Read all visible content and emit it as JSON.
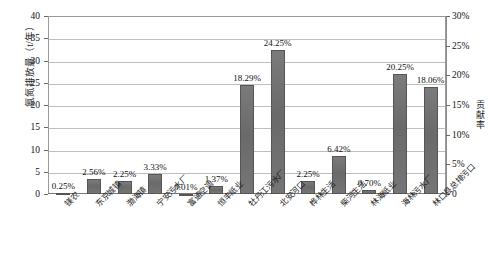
{
  "chart_data": {
    "type": "bar",
    "title": "",
    "xlabel": "",
    "ylabel": "氨氮排放量（t/年）",
    "y2label": "贡献率",
    "ylim": [
      0,
      40
    ],
    "y2lim": [
      0,
      0.3
    ],
    "grid": true,
    "legend": "none",
    "categories": [
      "镁农",
      "东京城镇",
      "渤海镇",
      "宁安污水厂",
      "富通空调",
      "恒丰纸业",
      "牡丹江污水厂",
      "北安河口",
      "桦林生活",
      "柴河生活",
      "林海纸业",
      "海林污水厂",
      "林口县总排污口"
    ],
    "values": [
      0.33,
      3.41,
      3.0,
      4.44,
      0.01,
      1.83,
      24.39,
      32.33,
      3.0,
      8.56,
      0.93,
      27.0,
      24.08
    ],
    "data_labels": [
      "0.25%",
      "2.56%",
      "2.25%",
      "3.33%",
      "0.01%",
      "1.37%",
      "18.29%",
      "24.25%",
      "2.25%",
      "6.42%",
      "0.70%",
      "20.25%",
      "18.06%"
    ],
    "contribution_rates": [
      0.25,
      2.56,
      2.25,
      3.33,
      0.01,
      1.37,
      18.29,
      24.25,
      2.25,
      6.42,
      0.7,
      20.25,
      18.06
    ],
    "yticks": [
      "0",
      "5",
      "10",
      "15",
      "20",
      "25",
      "30",
      "35",
      "40"
    ],
    "y2ticks": [
      "0",
      "5%",
      "10%",
      "15%",
      "20%",
      "25%",
      "30%"
    ],
    "series_color": "#6e6e6e"
  },
  "caption": ""
}
